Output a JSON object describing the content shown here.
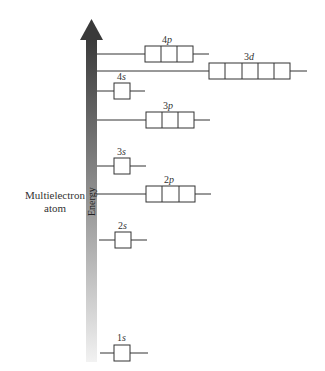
{
  "side_label": {
    "line1": "Multielectron",
    "line2": "atom"
  },
  "axis_label": "Energy",
  "colors": {
    "arrow_top": "#3a3a3a",
    "arrow_bottom": "#f2f2f2",
    "line": "#333333"
  },
  "orbitals": [
    {
      "n": "4",
      "l": "p",
      "boxes": 3,
      "level_y": 54
    },
    {
      "n": "3",
      "l": "d",
      "boxes": 5,
      "level_y": 71
    },
    {
      "n": "4",
      "l": "s",
      "boxes": 1,
      "level_y": 91
    },
    {
      "n": "3",
      "l": "p",
      "boxes": 3,
      "level_y": 120
    },
    {
      "n": "3",
      "l": "s",
      "boxes": 1,
      "level_y": 166
    },
    {
      "n": "2",
      "l": "p",
      "boxes": 3,
      "level_y": 194
    },
    {
      "n": "2",
      "l": "s",
      "boxes": 1,
      "level_y": 240
    },
    {
      "n": "1",
      "l": "s",
      "boxes": 1,
      "level_y": 353
    }
  ]
}
